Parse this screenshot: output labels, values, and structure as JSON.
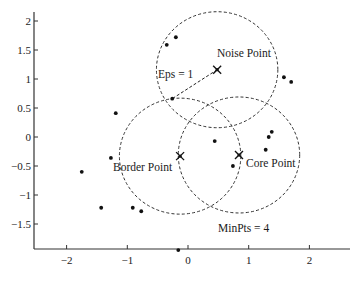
{
  "chart_data": {
    "type": "scatter",
    "title": "",
    "xlabel": "",
    "ylabel": "",
    "xlim": [
      -2.6,
      2.7
    ],
    "ylim": [
      -1.9,
      2.15
    ],
    "xticks": [
      -2,
      -1,
      0,
      1,
      2
    ],
    "xtick_labels": [
      "−2",
      "−1",
      "0",
      "1",
      "2"
    ],
    "yticks": [
      2,
      1.5,
      1,
      0.5,
      0,
      -0.5,
      -1,
      -1.5
    ],
    "ytick_labels": [
      "2",
      "1.5",
      "1",
      "0.5",
      "0",
      "−0.5",
      "−1",
      "−1.5"
    ],
    "grid": false,
    "points": [
      {
        "x": -0.2,
        "y": 1.72
      },
      {
        "x": -0.35,
        "y": 1.59
      },
      {
        "x": 1.58,
        "y": 1.03
      },
      {
        "x": 1.7,
        "y": 0.95
      },
      {
        "x": -1.19,
        "y": 0.41
      },
      {
        "x": -0.26,
        "y": 0.66
      },
      {
        "x": 1.38,
        "y": 0.09
      },
      {
        "x": 1.33,
        "y": 0.0
      },
      {
        "x": 1.28,
        "y": -0.22
      },
      {
        "x": 0.44,
        "y": -0.07
      },
      {
        "x": 0.74,
        "y": -0.5
      },
      {
        "x": -1.27,
        "y": -0.36
      },
      {
        "x": -1.75,
        "y": -0.6
      },
      {
        "x": -1.43,
        "y": -1.22
      },
      {
        "x": -0.91,
        "y": -1.22
      },
      {
        "x": -0.77,
        "y": -1.28
      },
      {
        "x": -0.16,
        "y": -1.95
      }
    ],
    "special_points": [
      {
        "name": "noise",
        "label": "Noise Point",
        "x": 0.48,
        "y": 1.16,
        "marker": "x"
      },
      {
        "name": "border",
        "label": "Border Point",
        "x": -0.13,
        "y": -0.33,
        "marker": "x"
      },
      {
        "name": "core",
        "label": "Core Point",
        "x": 0.84,
        "y": -0.31,
        "marker": "x"
      }
    ],
    "eps_circles": [
      {
        "center": "noise",
        "radius": 1
      },
      {
        "center": "border",
        "radius": 1
      },
      {
        "center": "core",
        "radius": 1
      }
    ],
    "eps_radius_line": {
      "from": {
        "x": 0.48,
        "y": 1.16
      },
      "to": {
        "x": -0.26,
        "y": 0.66
      }
    },
    "annotations": [
      {
        "text": "Eps = 1",
        "x": -0.3,
        "y": 1.12
      },
      {
        "text": "Noise Point",
        "x": 0.18,
        "y": 1.46
      },
      {
        "text": "Border Point",
        "x": -1.22,
        "y": -0.52
      },
      {
        "text": "Core Point",
        "x": 0.94,
        "y": -0.46
      },
      {
        "text": "MinPts = 4",
        "x": 0.5,
        "y": -1.62
      }
    ]
  },
  "labels": {
    "eps": "Eps = 1",
    "noise": "Noise Point",
    "border": "Border Point",
    "core": "Core Point",
    "minpts": "MinPts = 4"
  }
}
